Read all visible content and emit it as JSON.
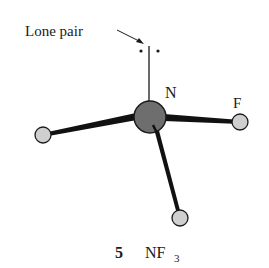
{
  "diagram": {
    "molecule": "NF3",
    "labels": {
      "lone_pair": "Lone pair",
      "central_atom": "N",
      "fluorine": "F"
    },
    "caption": {
      "number": "5",
      "formula_main": "NF",
      "formula_subscript": "3"
    },
    "atoms": [
      {
        "id": "N",
        "cx": 150,
        "cy": 117,
        "r": 16,
        "fill": "#6e6e6e"
      },
      {
        "id": "F-left",
        "cx": 43,
        "cy": 135,
        "r": 8,
        "fill": "#cfcfcf"
      },
      {
        "id": "F-right",
        "cx": 240,
        "cy": 122,
        "r": 8,
        "fill": "#cfcfcf"
      },
      {
        "id": "F-bottom",
        "cx": 180,
        "cy": 218,
        "r": 8,
        "fill": "#cfcfcf"
      }
    ]
  }
}
